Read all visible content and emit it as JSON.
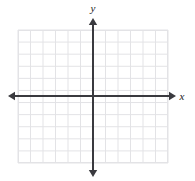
{
  "figure": {
    "kind": "coordinate-grid",
    "title": "",
    "background_color": "#ffffff"
  },
  "chart_data": {
    "type": "scatter",
    "title": "",
    "xlabel": "x",
    "ylabel": "y",
    "grid": true,
    "legend": null,
    "series": [],
    "x": [],
    "values": [],
    "xlim": [
      -6,
      6
    ],
    "ylim": [
      -5,
      6
    ],
    "x_tick_count": 12,
    "y_tick_count": 11,
    "x_tick_labels": [],
    "y_tick_labels": [],
    "annotations": []
  },
  "grid": {
    "left_px": 18,
    "top_px": 30,
    "width_px": 150,
    "height_px": 133,
    "columns": 12,
    "rows": 11,
    "cell_width_px": 12.5,
    "cell_height_px": 12.09,
    "line_color": "#e3e3e6",
    "border_color": "#e3e3e6"
  },
  "axes": {
    "origin_x_px": 93,
    "origin_y_px": 96,
    "color": "#3a3a3f",
    "stroke_width_px": 2,
    "x_axis": {
      "label": "x",
      "label_x_px": 182,
      "label_y_px": 100,
      "start_x_px": 8,
      "end_x_px": 176,
      "arrow_left": true,
      "arrow_right": true
    },
    "y_axis": {
      "label": "y",
      "label_x_px": 93,
      "label_y_px": 12,
      "start_y_px": 18,
      "end_y_px": 177,
      "arrow_up": true,
      "arrow_down": true
    }
  }
}
